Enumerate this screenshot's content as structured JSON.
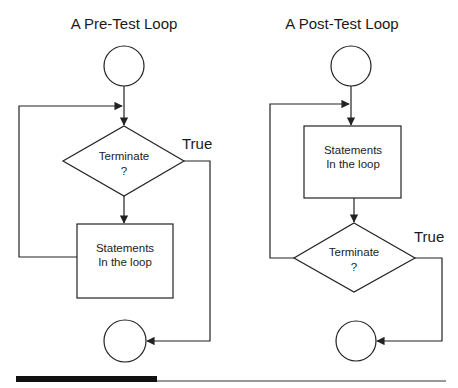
{
  "diagrams": [
    {
      "title": "A Pre-Test Loop",
      "decision": {
        "line1": "Terminate",
        "line2": "?"
      },
      "process": {
        "line1": "Statements",
        "line2": "In the loop"
      },
      "branch_label": "True"
    },
    {
      "title": "A Post-Test Loop",
      "process": {
        "line1": "Statements",
        "line2": "In the loop"
      },
      "decision": {
        "line1": "Terminate",
        "line2": "?"
      },
      "branch_label": "True"
    }
  ],
  "colors": {
    "line": "#222222",
    "background": "#ffffff",
    "footer_bar": "#111111"
  }
}
